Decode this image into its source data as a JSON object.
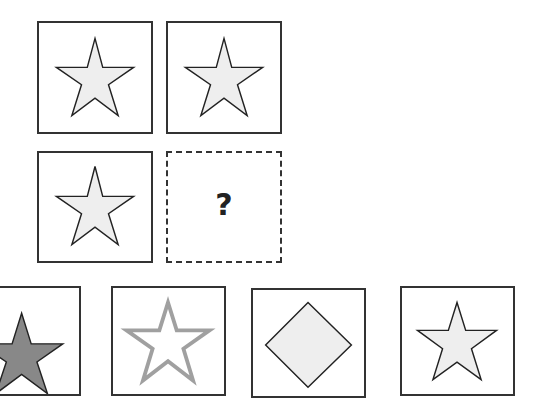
{
  "puzzle": {
    "grid": [
      {
        "row": 1,
        "col": 1,
        "shape": "star",
        "fill": "#eeeeee",
        "stroke": "#222222"
      },
      {
        "row": 1,
        "col": 2,
        "shape": "star",
        "fill": "#eeeeee",
        "stroke": "#222222"
      },
      {
        "row": 2,
        "col": 1,
        "shape": "star",
        "fill": "#eeeeee",
        "stroke": "#222222"
      },
      {
        "row": 2,
        "col": 2,
        "shape": "missing",
        "label": "?"
      }
    ],
    "missing_label": "?",
    "options": [
      {
        "index": 1,
        "shape": "star",
        "fill": "#888888",
        "stroke": "#222222"
      },
      {
        "index": 2,
        "shape": "star-outline",
        "fill": "#ffffff",
        "stroke": "#a0a0a0"
      },
      {
        "index": 3,
        "shape": "diamond",
        "fill": "#eeeeee",
        "stroke": "#222222"
      },
      {
        "index": 4,
        "shape": "star",
        "fill": "#eeeeee",
        "stroke": "#222222"
      }
    ]
  }
}
